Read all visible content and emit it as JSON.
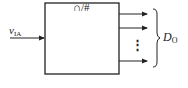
{
  "diagram": {
    "block_label": "∩/#",
    "input": {
      "symbol": "v",
      "subscript": "IA"
    },
    "output": {
      "symbol": "D",
      "subscript": "O"
    },
    "ellipsis": "⋮",
    "colors": {
      "stroke": "#222222",
      "background": "#ffffff"
    }
  }
}
